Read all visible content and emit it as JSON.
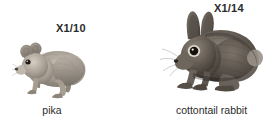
{
  "figure": {
    "background_color": "#ffffff",
    "text_color": "#2b2b2b",
    "panels": [
      {
        "id": "pika",
        "scale_label": "X1/10",
        "caption": "pika",
        "illustration": "pika-illustration",
        "description": "small gray-brown pika in profile facing left with short rounded ears",
        "fur_color": "#9a9288"
      },
      {
        "id": "cottontail-rabbit",
        "scale_label": "X1/14",
        "caption": "cottontail rabbit",
        "illustration": "cottontail-rabbit-illustration",
        "description": "dark brown-gray crouching cottontail rabbit facing left with long upright ears",
        "fur_color": "#5c564e"
      }
    ]
  }
}
